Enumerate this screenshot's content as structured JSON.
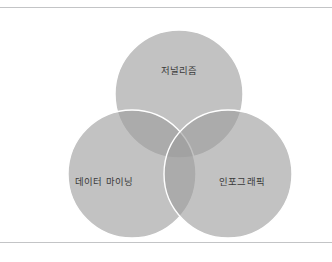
{
  "diagram": {
    "type": "venn-3-circle",
    "title": "",
    "background_color": "#ffffff",
    "frame": {
      "top_rule_color": "#c3c4c6",
      "bottom_rule_color": "#c3c4c6"
    },
    "circle_fill": "#9d9d9d",
    "circle_fill_opacity": 0.62,
    "circle_stroke": "#ffffff",
    "circle_stroke_width": 1.4,
    "label_color": "#3a3a3a",
    "sets": [
      {
        "id": "journalism",
        "label": "저널리즘",
        "position": "top",
        "cx": 179,
        "cy": 86,
        "r": 64,
        "label_x": 179,
        "label_y": 63,
        "fill": "#9d9d9d"
      },
      {
        "id": "data-mining",
        "label": "데이터 마이닝",
        "position": "bottom-left",
        "cx": 132,
        "cy": 166,
        "r": 64,
        "label_x": 104,
        "label_y": 174,
        "fill": "#9d9d9d"
      },
      {
        "id": "infographics",
        "label": "인포그래픽",
        "position": "bottom-right",
        "cx": 228,
        "cy": 166,
        "r": 64,
        "label_x": 242,
        "label_y": 174,
        "fill": "#9d9d9d"
      }
    ],
    "overlaps": [
      {
        "id": "journalism-data-mining",
        "label": ""
      },
      {
        "id": "journalism-infographics",
        "label": ""
      },
      {
        "id": "data-mining-infographics",
        "label": ""
      },
      {
        "id": "all-three",
        "label": ""
      }
    ]
  }
}
